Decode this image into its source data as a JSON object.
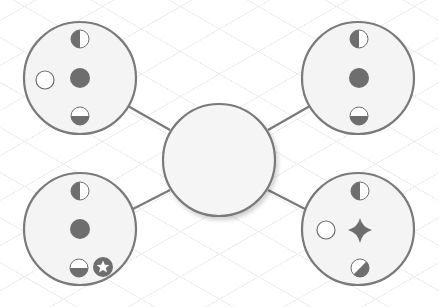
{
  "diagram": {
    "type": "hub-and-spoke",
    "colors": {
      "stroke": "#7a7a7a",
      "fill_node": "#f4f4f4",
      "icon_fill": "#6e6e6e",
      "background": "#ffffff",
      "grid": "#ececec"
    },
    "center_node": {
      "id": "center",
      "label": ""
    },
    "nodes": [
      {
        "id": "top-left",
        "icons": [
          "half-left-filled-circle",
          "filled-circle",
          "empty-circle",
          "bottom-half-filled-circle"
        ]
      },
      {
        "id": "top-right",
        "icons": [
          "half-left-filled-circle",
          "filled-circle",
          "bottom-half-filled-circle"
        ]
      },
      {
        "id": "bottom-left",
        "icons": [
          "half-left-filled-circle",
          "filled-circle",
          "bottom-half-filled-circle",
          "star-badge"
        ]
      },
      {
        "id": "bottom-right",
        "icons": [
          "half-left-filled-circle",
          "four-point-star",
          "empty-circle",
          "diagonal-half-filled-circle"
        ]
      }
    ]
  }
}
